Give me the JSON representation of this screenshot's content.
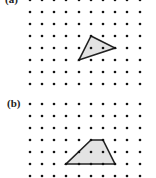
{
  "panels": [
    {
      "label": "(a)",
      "label_pos": [
        5,
        -6
      ],
      "grid": {
        "cols_x": [
          30,
          42,
          54,
          66,
          79,
          91,
          103,
          115,
          127,
          140
        ],
        "rows_y": [
          0,
          12,
          24,
          36,
          48,
          60,
          72,
          84
        ]
      },
      "shape": {
        "type": "triangle",
        "vertices": [
          [
            91,
            36
          ],
          [
            115,
            48
          ],
          [
            79,
            60
          ]
        ],
        "grid_vertices": [
          [
            5,
            3
          ],
          [
            7,
            4
          ],
          [
            4,
            5
          ]
        ]
      }
    },
    {
      "label": "(b)",
      "label_pos": [
        7,
        98
      ],
      "grid": {
        "cols_x": [
          30,
          42,
          54,
          66,
          79,
          91,
          103,
          115,
          127,
          140
        ],
        "rows_y": [
          104,
          116,
          128,
          140,
          152,
          164,
          176
        ]
      },
      "shape": {
        "type": "trapezoid",
        "vertices": [
          [
            91,
            140
          ],
          [
            103,
            140
          ],
          [
            115,
            164
          ],
          [
            66,
            164
          ]
        ],
        "grid_vertices": [
          [
            5,
            3
          ],
          [
            6,
            3
          ],
          [
            7,
            5
          ],
          [
            3,
            5
          ]
        ]
      }
    }
  ],
  "colors": {
    "dot": "#111111",
    "stroke": "#222222",
    "fill": "#e3e3e3",
    "background": "#ffffff"
  }
}
